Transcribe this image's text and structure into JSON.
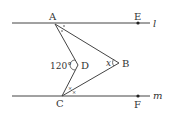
{
  "diagram": {
    "lines": {
      "l": {
        "label": "l",
        "y": 23
      },
      "m": {
        "label": "m",
        "y": 96
      }
    },
    "points": {
      "A": {
        "label": "A",
        "x": 55,
        "y": 24
      },
      "E": {
        "label": "E",
        "x": 138,
        "y": 23
      },
      "B": {
        "label": "B",
        "x": 119,
        "y": 63
      },
      "D": {
        "label": "D",
        "x": 78,
        "y": 65
      },
      "C": {
        "label": "C",
        "x": 62,
        "y": 96
      },
      "F": {
        "label": "F",
        "x": 138,
        "y": 96
      }
    },
    "angle_labels": {
      "D": "120°",
      "B": "x"
    },
    "colors": {
      "stroke": "#444444",
      "text": "#333333"
    }
  }
}
